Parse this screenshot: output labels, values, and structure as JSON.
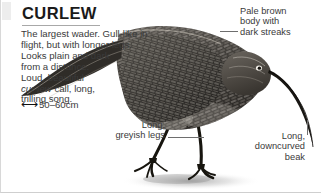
{
  "page": {
    "title": "CURLEW",
    "description_line1": "The largest wader. Gull-like in",
    "description_line2": "flight, but with longer legs.",
    "description_line3": "Looks plain and dark",
    "description_line4": "from a distance.",
    "description_line5": "Loud, beautiful",
    "description_line6_italic": "cur-lew",
    "description_line6_rest": " call, long,",
    "description_line7": "trilling song.",
    "size_icon": "double-headed-arrow",
    "size_value": "50–60cm"
  },
  "callouts": [
    {
      "id": "pale-brown-body",
      "line1": "Pale brown",
      "line2": "body with",
      "line3": "dark streaks"
    },
    {
      "id": "long-greyish-legs",
      "line1": "Long,",
      "line2": "greyish legs"
    },
    {
      "id": "long-downcurved-beak",
      "line1": "Long,",
      "line2": "downcurved",
      "line3": "beak"
    }
  ],
  "illustration": {
    "subject": "curlew-bird",
    "description": "Wading bird in profile facing right with long downcurved bill, streaked brown plumage and long legs on ground shadow"
  },
  "colors": {
    "text": "#3a3a3a",
    "title": "#1a1a1a",
    "rule": "#a8a8a8",
    "leader": "#6e6e6e",
    "background": "#ffffff"
  }
}
